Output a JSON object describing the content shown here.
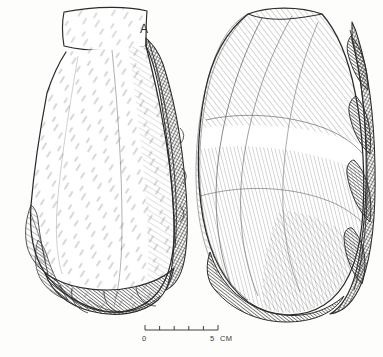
{
  "plate": {
    "title": "Lithic artifact plate",
    "medium": "ink line drawing",
    "background_color": "#fdfdfc",
    "ink_color": "#2b2b2b",
    "figure_label": "A",
    "object_count": 2
  },
  "artifacts": [
    {
      "id": "artifact-left",
      "view": "dorsal face / cortex face",
      "outline_shape": "elongated pear, flat trapezoidal striking platform at top, worked edge at base",
      "label": "A",
      "features": [
        "flat striking platform",
        "cortex surface",
        "cross-hatched right margin",
        "flake-scar notches on lower left",
        "bifacial working edge at base"
      ]
    },
    {
      "id": "artifact-right",
      "view": "ventral face",
      "outline_shape": "rounded ovate / teardrop with scalloped retouched right edge",
      "label": "",
      "features": [
        "sweeping conchoidal ripple hatching",
        "dark retouched right margin",
        "rounded distal end"
      ]
    }
  ],
  "scale": {
    "name": "scale-bar",
    "start_label": "0",
    "end_label": "5",
    "unit": "CM",
    "min": 0,
    "max": 5,
    "tick_count": 6,
    "tick_values": [
      0,
      1,
      2,
      3,
      4,
      5
    ],
    "bar_length_px": 73
  }
}
